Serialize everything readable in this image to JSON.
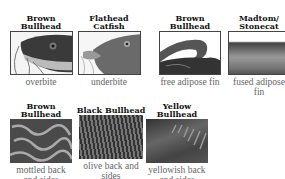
{
  "panels": [
    {
      "title_lines": [
        "Brown",
        "Bullhead"
      ],
      "caption": "overbite",
      "image": "fish-head-overbite-icon"
    },
    {
      "title_lines": [
        "Flathead",
        "Catfish"
      ],
      "caption": "underbite",
      "image": "fish-head-underbite-icon"
    },
    {
      "title_lines": [
        "Brown",
        "Bullhead"
      ],
      "caption": "free adipose fin",
      "image": "free-adipose-fin-icon"
    },
    {
      "title_lines": [
        "Madtom/",
        "Stonecat"
      ],
      "caption_lines": [
        "fused adipose",
        "fin"
      ],
      "image": "fused-adipose-fin-icon"
    },
    {
      "title_lines": [
        "Brown",
        "Bullhead"
      ],
      "caption_lines": [
        "mottled back",
        "and sides"
      ],
      "image": "mottled-skin-icon"
    },
    {
      "title_lines": [
        "Black Bullhead"
      ],
      "caption_lines": [
        "olive back and",
        "sides"
      ],
      "image": "olive-skin-icon"
    },
    {
      "title_lines": [
        "Yellow",
        "Bullhead"
      ],
      "caption_lines": [
        "yellowish back",
        "and sides"
      ],
      "image": "yellowish-skin-icon"
    }
  ]
}
